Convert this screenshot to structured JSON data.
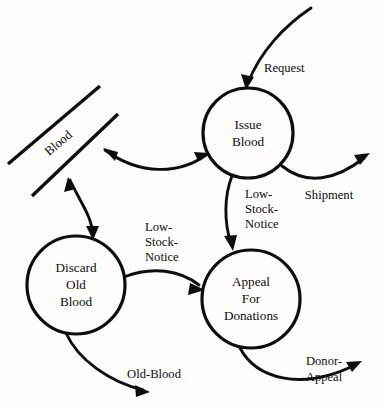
{
  "diagram": {
    "type": "data-flow-diagram",
    "background_color": "#fdfdfc",
    "ink_color": "#0d0d0d",
    "width": 383,
    "height": 406,
    "processes": [
      {
        "id": "issue-blood",
        "label_lines": [
          "Issue",
          "Blood"
        ],
        "cx": 248,
        "cy": 133,
        "r": 45
      },
      {
        "id": "discard-old-blood",
        "label_lines": [
          "Discard",
          "Old",
          "Blood"
        ],
        "cx": 76,
        "cy": 285,
        "r": 49
      },
      {
        "id": "appeal-for-donations",
        "label_lines": [
          "Appeal",
          "For",
          "Donations"
        ],
        "cx": 251,
        "cy": 299,
        "r": 49
      }
    ],
    "stores": [
      {
        "id": "blood-store",
        "label": "Blood",
        "line_upper": {
          "x1": 8,
          "y1": 164,
          "x2": 100,
          "y2": 86
        },
        "line_lower": {
          "x1": 32,
          "y1": 196,
          "x2": 118,
          "y2": 114
        },
        "label_x": 59,
        "label_y": 144,
        "label_rotation": -40
      }
    ],
    "flows": [
      {
        "id": "request",
        "label": "Request",
        "label_x": 264,
        "label_y": 69,
        "label_anchor": "start",
        "from": "external",
        "to": "issue-blood",
        "arrowheads": "end"
      },
      {
        "id": "shipment",
        "label": "Shipment",
        "label_x": 329,
        "label_y": 196,
        "label_anchor": "middle",
        "from": "issue-blood",
        "to": "external",
        "arrowheads": "end"
      },
      {
        "id": "blood-issue-exchange",
        "label": "",
        "from": "blood-store",
        "to": "issue-blood",
        "arrowheads": "both"
      },
      {
        "id": "blood-discard-exchange",
        "label": "",
        "from": "blood-store",
        "to": "discard-old-blood",
        "arrowheads": "both"
      },
      {
        "id": "low-stock-notice-issue",
        "label_lines": [
          "Low-",
          "Stock-",
          "Notice"
        ],
        "label_x": 262,
        "label_y": 206,
        "label_anchor": "start",
        "from": "issue-blood",
        "to": "appeal-for-donations",
        "arrowheads": "end"
      },
      {
        "id": "low-stock-notice-discard",
        "label_lines": [
          "Low-",
          "Stock-",
          "Notice"
        ],
        "label_x": 148,
        "label_y": 238,
        "label_anchor": "start",
        "from": "discard-old-blood",
        "to": "appeal-for-donations",
        "arrowheads": "end"
      },
      {
        "id": "old-blood",
        "label": "Old-Blood",
        "label_x": 154,
        "label_y": 375,
        "label_anchor": "middle",
        "from": "discard-old-blood",
        "to": "external",
        "arrowheads": "end"
      },
      {
        "id": "donor-appeal",
        "label_lines": [
          "Donor-",
          "Appeal"
        ],
        "label_x": 324,
        "label_y": 370,
        "label_anchor": "middle",
        "from": "appeal-for-donations",
        "to": "external",
        "arrowheads": "end"
      }
    ]
  }
}
